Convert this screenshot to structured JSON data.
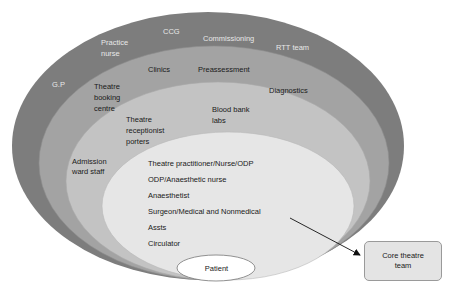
{
  "diagram": {
    "type": "nested-ellipses",
    "layers": [
      {
        "id": "outer",
        "color": "#7d7d7d",
        "labels": [
          "G.P",
          "Practice\nnurse",
          "CCG",
          "Commissioning",
          "RTT team"
        ]
      },
      {
        "id": "second",
        "color": "#a3a3a3",
        "labels": [
          "Theatre\nbooking\ncentre",
          "Clinics",
          "Preassessment",
          "Diagnostics"
        ]
      },
      {
        "id": "third",
        "color": "#c3c3c3",
        "labels": [
          "Theatre\nreceptionist\nporters",
          "Blood bank\nlabs",
          "Admission\nward staff"
        ]
      },
      {
        "id": "core",
        "color": "#e6e6e6",
        "labels": [
          "Theatre practitioner/Nurse/ODP",
          "ODP/Anaesthetic nurse",
          "Anaesthetist",
          "Surgeon/Medical and Nonmedical",
          "Assts",
          "Circulator"
        ]
      },
      {
        "id": "center",
        "color": "#ffffff",
        "labels": [
          "Patient"
        ]
      }
    ],
    "callout": {
      "label": "Core theatre team",
      "points_to": "core"
    }
  },
  "labels": {
    "gp": "G.P",
    "practice_nurse_1": "Practice",
    "practice_nurse_2": "nurse",
    "ccg": "CCG",
    "commissioning": "Commissioning",
    "rtt_team": "RTT team",
    "booking_1": "Theatre",
    "booking_2": "booking",
    "booking_3": "centre",
    "clinics": "Clinics",
    "preassessment": "Preassessment",
    "diagnostics": "Diagnostics",
    "reception_1": "Theatre",
    "reception_2": "receptionist",
    "reception_3": "porters",
    "bloodbank_1": "Blood bank",
    "bloodbank_2": "labs",
    "admission_1": "Admission",
    "admission_2": "ward staff",
    "core_1": "Theatre practitioner/Nurse/ODP",
    "core_2": "ODP/Anaesthetic nurse",
    "core_3": "Anaesthetist",
    "core_4": "Surgeon/Medical and Nonmedical",
    "core_5": "Assts",
    "core_6": "Circulator",
    "patient": "Patient",
    "core_team_1": "Core theatre",
    "core_team_2": "team"
  }
}
